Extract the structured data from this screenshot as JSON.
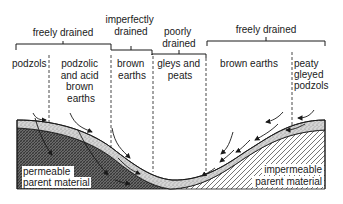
{
  "drainage_groups": [
    {
      "label": "freely drained",
      "lines": [
        "freely drained"
      ]
    },
    {
      "label": "imperfectly drained",
      "lines": [
        "imperfectly",
        "drained"
      ]
    },
    {
      "label": "poorly drained",
      "lines": [
        "poorly",
        "drained"
      ]
    },
    {
      "label": "freely drained",
      "lines": [
        "freely drained"
      ]
    }
  ],
  "soil_types": [
    {
      "lines": [
        "podzols"
      ]
    },
    {
      "lines": [
        "podzolic",
        "and acid",
        "brown",
        "earths"
      ]
    },
    {
      "lines": [
        "brown",
        "earths"
      ]
    },
    {
      "lines": [
        "gleys and",
        "peats"
      ]
    },
    {
      "lines": [
        "brown earths"
      ]
    },
    {
      "lines": [
        "peaty",
        "gleyed",
        "podzols"
      ]
    }
  ],
  "parent_materials": {
    "left": [
      "permeable",
      "parent material"
    ],
    "right": [
      "impermeable",
      "parent material"
    ]
  },
  "colors": {
    "ink": "#1a1a1a",
    "soil_layer": "#c8c8c8",
    "permeable_fill": "#555555",
    "background": "#ffffff"
  }
}
